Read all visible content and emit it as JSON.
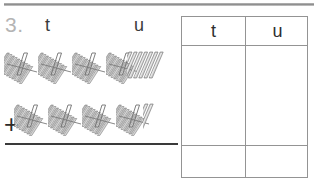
{
  "worksheet": {
    "problem_number": "3.",
    "column_labels": {
      "tens": "t",
      "units": "u"
    },
    "operator": "+"
  },
  "addend_rows": [
    {
      "tens_bundles": 4,
      "loose_units": 7
    },
    {
      "tens_bundles": 4,
      "loose_units": 2
    }
  ],
  "answer_table": {
    "headers": {
      "tens": "t",
      "units": "u"
    },
    "work_row": {
      "tens": "",
      "units": ""
    },
    "answer_row": {
      "tens": "",
      "units": ""
    }
  },
  "colors": {
    "rule_gray": "#8f8f8f",
    "number_gray": "#b4b4b4",
    "text_dark": "#2e2e2e",
    "table_border": "#949494",
    "stick_fill": "#c9c9c9",
    "stick_stroke": "#6f6f6f",
    "answer_rule": "#3a3a3a"
  },
  "chart_data": {
    "type": "table",
    "categories": [
      "t",
      "u"
    ],
    "series": [
      {
        "name": "first addend",
        "values": [
          4,
          7
        ]
      },
      {
        "name": "second addend",
        "values": [
          4,
          2
        ]
      }
    ],
    "xlabel": "place value column",
    "ylabel": "count of objects"
  }
}
